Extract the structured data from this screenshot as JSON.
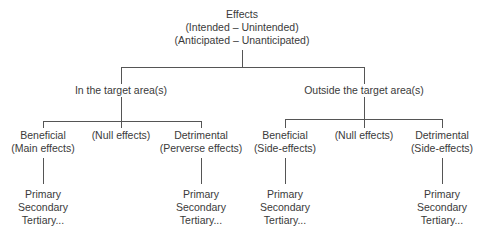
{
  "root": {
    "title": "Effects",
    "line2": "(Intended – Unintended)",
    "line3": "(Anticipated – Unanticipated)"
  },
  "branches": [
    {
      "label": "In the target area(s)",
      "children": [
        {
          "line1": "Beneficial",
          "line2": "(Main effects)",
          "leaves": [
            "Primary",
            "Secondary",
            "Tertiary..."
          ]
        },
        {
          "line1": "(Null effects)",
          "line2": "",
          "leaves": []
        },
        {
          "line1": "Detrimental",
          "line2": "(Perverse effects)",
          "leaves": [
            "Primary",
            "Secondary",
            "Tertiary..."
          ]
        }
      ]
    },
    {
      "label": "Outside the target area(s)",
      "children": [
        {
          "line1": "Beneficial",
          "line2": "(Side-effects)",
          "leaves": [
            "Primary",
            "Secondary",
            "Tertiary..."
          ]
        },
        {
          "line1": "(Null effects)",
          "line2": "",
          "leaves": []
        },
        {
          "line1": "Detrimental",
          "line2": "(Side-effects)",
          "leaves": [
            "Primary",
            "Secondary",
            "Tertiary..."
          ]
        }
      ]
    }
  ],
  "colors": {
    "line": "#555555",
    "text": "#3a3a3a",
    "background": "#ffffff"
  }
}
